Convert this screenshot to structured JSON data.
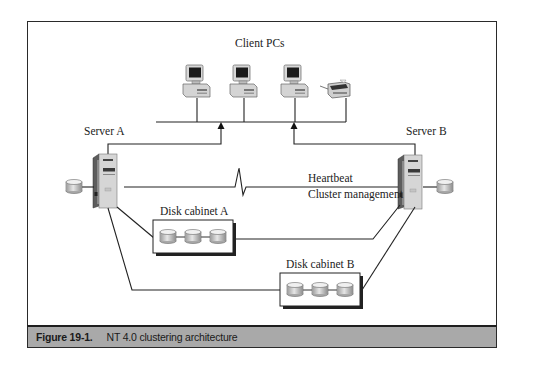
{
  "figure": {
    "title_labels": {
      "clients": "Client PCs",
      "server_a": "Server A",
      "server_b": "Server B",
      "heartbeat": "Heartbeat",
      "cluster_management": "Cluster management",
      "disk_cabinet_a": "Disk cabinet A",
      "disk_cabinet_b": "Disk cabinet B"
    },
    "nodes": [
      {
        "id": "client-pc-1",
        "type": "desktop-pc"
      },
      {
        "id": "client-pc-2",
        "type": "desktop-pc"
      },
      {
        "id": "client-pc-3",
        "type": "desktop-pc"
      },
      {
        "id": "printer",
        "type": "printer"
      },
      {
        "id": "server-a",
        "type": "tower-server",
        "label": "Server A"
      },
      {
        "id": "server-b",
        "type": "tower-server",
        "label": "Server B"
      },
      {
        "id": "server-a-local-disk",
        "type": "disk"
      },
      {
        "id": "server-b-local-disk",
        "type": "disk"
      },
      {
        "id": "disk-cabinet-a",
        "type": "disk-cabinet",
        "disks": 3,
        "label": "Disk cabinet A"
      },
      {
        "id": "disk-cabinet-b",
        "type": "disk-cabinet",
        "disks": 3,
        "label": "Disk cabinet B"
      }
    ],
    "edges": [
      {
        "from": "server-a",
        "to": "client-bus"
      },
      {
        "from": "server-b",
        "to": "client-bus"
      },
      {
        "from": "server-a",
        "to": "server-b",
        "label": "Heartbeat / Cluster management"
      },
      {
        "from": "server-a",
        "to": "disk-cabinet-a"
      },
      {
        "from": "server-a",
        "to": "disk-cabinet-b"
      },
      {
        "from": "server-b",
        "to": "disk-cabinet-a"
      },
      {
        "from": "server-b",
        "to": "disk-cabinet-b"
      },
      {
        "from": "server-a",
        "to": "server-a-local-disk"
      },
      {
        "from": "server-b",
        "to": "server-b-local-disk"
      }
    ],
    "colors": {
      "frame": "#2a2a2a",
      "caption_bg": "#a9a9a9",
      "line": "#222222"
    }
  },
  "caption": {
    "number": "Figure 19-1.",
    "text": "NT 4.0 clustering architecture"
  }
}
